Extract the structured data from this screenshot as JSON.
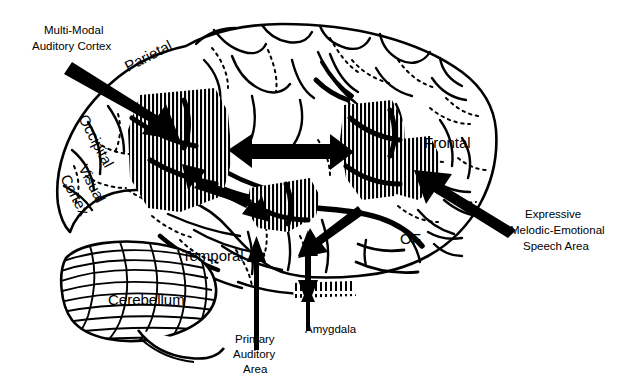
{
  "figure": {
    "background_color": "#ffffff",
    "ink_color": "#000000",
    "width": 617,
    "height": 391
  },
  "callout_labels": [
    {
      "id": "multi-modal-auditory-cortex",
      "lines": [
        "Multi-Modal",
        "Auditory Cortex"
      ],
      "line1": "Multi-Modal",
      "line2": "Auditory Cortex"
    },
    {
      "id": "expressive-melodic-emotional-speech-area",
      "lines": [
        "Expressive",
        "Melodic-Emotional",
        "Speech Area"
      ],
      "line1": "Expressive",
      "line2": "Melodic-Emotional",
      "line3": "Speech Area"
    },
    {
      "id": "primary-auditory-area",
      "lines": [
        "Primary",
        "Auditory",
        "Area"
      ],
      "line1": "Primary",
      "line2": "Auditory",
      "line3": "Area"
    },
    {
      "id": "amygdala",
      "lines": [
        "Amygdala"
      ],
      "line1": "Amygdala"
    }
  ],
  "region_labels": [
    {
      "id": "parietal",
      "text": "Parietal",
      "rotated": true
    },
    {
      "id": "occipital",
      "text": "Occipital",
      "rotated": true
    },
    {
      "id": "visual",
      "text": "Visual",
      "rotated": true
    },
    {
      "id": "cortex",
      "text": "Cortex",
      "rotated": true
    },
    {
      "id": "temporal",
      "text": "Temporal",
      "rotated": false
    },
    {
      "id": "cerebellum",
      "text": "Cerebellum",
      "rotated": false
    },
    {
      "id": "frontal",
      "text": "Frontal",
      "rotated": false
    },
    {
      "id": "of",
      "text": "OF",
      "rotated": false
    }
  ],
  "hatched_areas": [
    {
      "id": "wernicke-multimodal-area",
      "hatch": "vertical-dense"
    },
    {
      "id": "superior-temporal-area",
      "hatch": "vertical-dense"
    },
    {
      "id": "broca-area",
      "hatch": "vertical-dense"
    },
    {
      "id": "orbital-frontal-speech-area",
      "hatch": "vertical-dense"
    },
    {
      "id": "amygdala-area",
      "hatch": "vertical-short"
    }
  ],
  "arrows": [
    {
      "id": "arrow-multimodal-pointer",
      "kind": "single",
      "direction": "down-right"
    },
    {
      "id": "arrow-expressive-pointer",
      "kind": "single",
      "direction": "up-left"
    },
    {
      "id": "arrow-temporal-frontal-bidirectional",
      "kind": "double",
      "direction": "horizontal"
    },
    {
      "id": "arrow-temporal-to-multimodal",
      "kind": "single",
      "direction": "up-left"
    },
    {
      "id": "arrow-multimodal-to-temporal",
      "kind": "single",
      "direction": "down-right"
    },
    {
      "id": "arrow-frontal-to-temporal-diagonal",
      "kind": "single",
      "direction": "down-left"
    },
    {
      "id": "arrow-primary-auditory-up",
      "kind": "single",
      "direction": "up"
    },
    {
      "id": "arrow-amygdala-bidirectional",
      "kind": "double",
      "direction": "vertical"
    },
    {
      "id": "arrow-amygdala-pointer",
      "kind": "single",
      "direction": "up"
    }
  ]
}
